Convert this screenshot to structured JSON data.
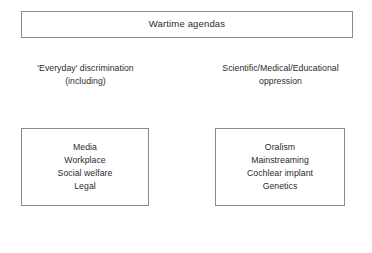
{
  "slide": {
    "title_box": {
      "title": "Wartime agendas"
    },
    "columns": [
      {
        "header_line1": "'Everyday' discrimination",
        "header_line2": "(including)",
        "items": [
          "Media",
          "Workplace",
          "Social welfare",
          "Legal"
        ]
      },
      {
        "header_line1": "Scientific/Medical/Educational",
        "header_line2": "oppression",
        "items": [
          "Oralism",
          "Mainstreaming",
          "Cochlear implant",
          "Genetics"
        ]
      }
    ],
    "colors": {
      "background": "#ffffff",
      "border": "#8a8a8a",
      "text": "#2b2b2b"
    }
  }
}
